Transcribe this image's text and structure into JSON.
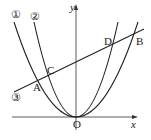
{
  "diagram": {
    "axes": {
      "x_label": "x",
      "y_label": "y",
      "origin_label": "O"
    },
    "curves": [
      {
        "id": "curve-1",
        "label": "①",
        "type": "parabola",
        "description": "wider parabola y = a·x², a > 0"
      },
      {
        "id": "curve-2",
        "label": "②",
        "type": "parabola",
        "description": "narrower parabola y = b·x², b > a"
      },
      {
        "id": "line-3",
        "label": "③",
        "type": "line",
        "description": "line with positive slope"
      }
    ],
    "points": [
      {
        "label": "A",
        "on": [
          "①",
          "③"
        ]
      },
      {
        "label": "C",
        "on": [
          "②",
          "③"
        ]
      },
      {
        "label": "D",
        "on": [
          "②",
          "③"
        ]
      },
      {
        "label": "B",
        "on": [
          "①",
          "③"
        ]
      }
    ]
  }
}
